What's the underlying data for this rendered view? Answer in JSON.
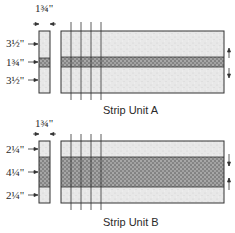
{
  "diagram": {
    "units": [
      {
        "name": "Strip Unit A",
        "caption": "Strip Unit A",
        "width_label": "1¾\"",
        "strip_labels": [
          "3½\"",
          "1¾\"",
          "3½\""
        ],
        "strips": [
          {
            "position": "top",
            "height": "3½\"",
            "fabric": "light"
          },
          {
            "position": "middle",
            "height": "1¾\"",
            "fabric": "dark"
          },
          {
            "position": "bottom",
            "height": "3½\"",
            "fabric": "light"
          }
        ]
      },
      {
        "name": "Strip Unit B",
        "caption": "Strip Unit B",
        "width_label": "1¾\"",
        "strip_labels": [
          "2¼\"",
          "4¼\"",
          "2¼\""
        ],
        "strips": [
          {
            "position": "top",
            "height": "2¼\"",
            "fabric": "light"
          },
          {
            "position": "middle",
            "height": "4¼\"",
            "fabric": "dark"
          },
          {
            "position": "bottom",
            "height": "2¼\"",
            "fabric": "light"
          }
        ]
      }
    ],
    "colors": {
      "light_fabric": "#e6e6e6",
      "dark_fabric": "#8a8a8a",
      "outline": "#333333"
    }
  }
}
